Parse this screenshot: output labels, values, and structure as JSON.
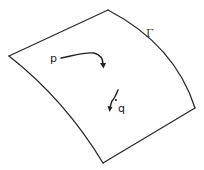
{
  "diagram": {
    "type": "surface-with-curves",
    "surface": {
      "label": "Γ",
      "corners": {
        "left": [
          9,
          56
        ],
        "top": [
          108,
          10
        ],
        "right": [
          195,
          108
        ],
        "bottom": [
          103,
          163
        ]
      },
      "stroke_color": "#2a2a2a"
    },
    "points": [
      {
        "id": "p",
        "label": "p",
        "position": [
          51,
          58
        ]
      },
      {
        "id": "q",
        "label": "q",
        "position": [
          117,
          103
        ]
      }
    ],
    "curves": [
      {
        "from": "p",
        "description": "curve from p bending down with arrowhead"
      },
      {
        "through": "q",
        "description": "short curve through q with arrowhead pointing down-left"
      }
    ]
  }
}
